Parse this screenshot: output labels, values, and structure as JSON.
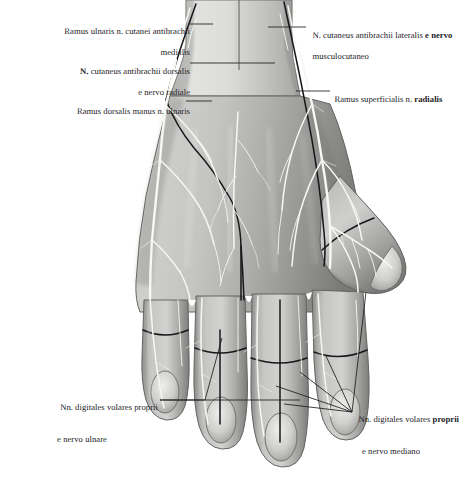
{
  "figure": {
    "kind": "anatomical-illustration",
    "view": "dorsal",
    "background_color": "#ffffff",
    "skin_tone_light": "#d9d9d7",
    "skin_tone_mid": "#b4b4b2",
    "skin_tone_dark": "#8e8e8c",
    "skin_tone_deep": "#6e6e6c",
    "nerve_color": "#f6f6f2",
    "outline_color": "#4a4a48",
    "leader_color": "#1c1c1c"
  },
  "labels": {
    "ramus_ulnaris_cutanei_antibrachii_medialis": {
      "line1": "Ramus ulnaris n. cutanei antibrachii",
      "line2": "medialis"
    },
    "n_cutaneus_antibrachii_dorsalis_radiale": {
      "line1_bold": "N.",
      "line1_rest": " cutaneus antibrachii dorsalis",
      "line2": "e nervo radiale"
    },
    "ramus_dorsalis_manus_ulnaris": {
      "line1": "Ramus dorsalis manus n. ulnaris"
    },
    "n_cutaneus_antibrachii_lateralis_musculocutaneo": {
      "line1_a": "N. cutaneus antibrachii lateralis ",
      "line1_b_bold": "e nervo",
      "line2": "musculocutaneo"
    },
    "ramus_superficialis_n_radialis": {
      "line1_a": "Ramus superficialis n. ",
      "line1_b_bold": "radialis"
    },
    "nn_digitales_volares_proprii_ulnare": {
      "line1": "Nn. digitales volares proprii",
      "line2": "e nervo ulnare"
    },
    "nn_digitales_volares_proprii_mediano": {
      "line1_a": "Nn. digitales volares ",
      "line1_b_bold": "proprii",
      "line2": "e nervo mediano"
    }
  }
}
